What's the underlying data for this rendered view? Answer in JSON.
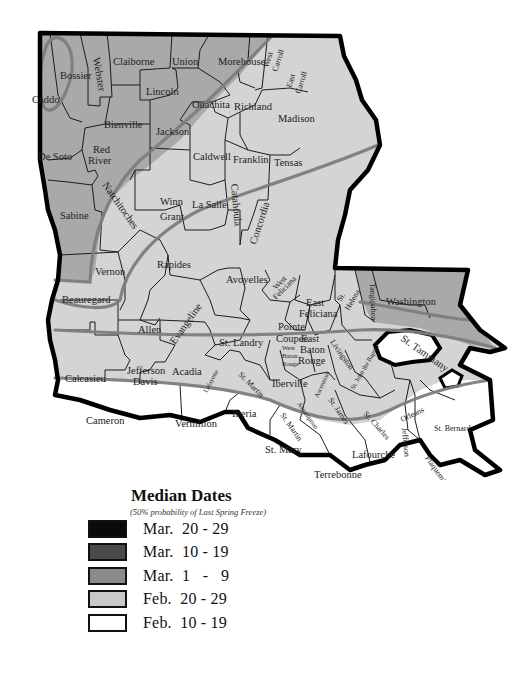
{
  "map": {
    "title": "Louisiana Median Dates of Last Spring Freeze",
    "parishes": [
      {
        "name": "Caddo",
        "zone": "mar1"
      },
      {
        "name": "Bossier",
        "zone": "mar1"
      },
      {
        "name": "Webster",
        "zone": "mar1"
      },
      {
        "name": "Claiborne",
        "zone": "mar1"
      },
      {
        "name": "Union",
        "zone": "mar1"
      },
      {
        "name": "Morehouse",
        "zone": "feb20"
      },
      {
        "name": "West Carroll",
        "zone": "feb20"
      },
      {
        "name": "East Carroll",
        "zone": "feb20"
      },
      {
        "name": "Lincoln",
        "zone": "mar1"
      },
      {
        "name": "Ouachita",
        "zone": "feb20"
      },
      {
        "name": "Richland",
        "zone": "feb20"
      },
      {
        "name": "Madison",
        "zone": "feb20"
      },
      {
        "name": "Bienville",
        "zone": "mar1"
      },
      {
        "name": "Jackson",
        "zone": "feb20"
      },
      {
        "name": "De Soto",
        "zone": "mar1"
      },
      {
        "name": "Red River",
        "zone": "mar1"
      },
      {
        "name": "Caldwell",
        "zone": "feb20"
      },
      {
        "name": "Franklin",
        "zone": "feb20"
      },
      {
        "name": "Tensas",
        "zone": "feb20"
      },
      {
        "name": "Winn",
        "zone": "feb20"
      },
      {
        "name": "Natchitoches",
        "zone": "feb20"
      },
      {
        "name": "Catahoula",
        "zone": "feb20"
      },
      {
        "name": "La Salle",
        "zone": "feb20"
      },
      {
        "name": "Grant",
        "zone": "feb20"
      },
      {
        "name": "Concordia",
        "zone": "feb20"
      },
      {
        "name": "Sabine",
        "zone": "mar1"
      },
      {
        "name": "Rapides",
        "zone": "feb20"
      },
      {
        "name": "Vernon",
        "zone": "feb20"
      },
      {
        "name": "Avoyelles",
        "zone": "feb20"
      },
      {
        "name": "West Feliciana",
        "zone": "feb20"
      },
      {
        "name": "East Feliciana",
        "zone": "feb20"
      },
      {
        "name": "St. Helena",
        "zone": "feb20"
      },
      {
        "name": "Washington",
        "zone": "mar1"
      },
      {
        "name": "Tangipahoa",
        "zone": "mar1"
      },
      {
        "name": "St. Tammany",
        "zone": "mar1"
      },
      {
        "name": "Beauregard",
        "zone": "feb20"
      },
      {
        "name": "Allen",
        "zone": "feb20"
      },
      {
        "name": "Evangeline",
        "zone": "feb20"
      },
      {
        "name": "Pointe Coupee",
        "zone": "feb20"
      },
      {
        "name": "East Baton Rouge",
        "zone": "feb20"
      },
      {
        "name": "West Baton Rouge",
        "zone": "feb20"
      },
      {
        "name": "St. Landry",
        "zone": "feb20"
      },
      {
        "name": "Livingston",
        "zone": "feb20"
      },
      {
        "name": "Calcasieu",
        "zone": "feb20"
      },
      {
        "name": "Jefferson Davis",
        "zone": "feb20"
      },
      {
        "name": "Acadia",
        "zone": "feb20"
      },
      {
        "name": "Lafayette",
        "zone": "feb20"
      },
      {
        "name": "St. Martin",
        "zone": "feb20"
      },
      {
        "name": "Iberville",
        "zone": "feb20"
      },
      {
        "name": "Ascension",
        "zone": "feb20"
      },
      {
        "name": "St. John the Baptist",
        "zone": "feb20"
      },
      {
        "name": "St. James",
        "zone": "feb20"
      },
      {
        "name": "Assumption",
        "zone": "feb20"
      },
      {
        "name": "St. Charles",
        "zone": "feb20"
      },
      {
        "name": "Orleans",
        "zone": "feb10"
      },
      {
        "name": "Cameron",
        "zone": "feb10"
      },
      {
        "name": "Vermilion",
        "zone": "feb10"
      },
      {
        "name": "Iberia",
        "zone": "feb10"
      },
      {
        "name": "St. Mary",
        "zone": "feb10"
      },
      {
        "name": "Lafourche",
        "zone": "feb10"
      },
      {
        "name": "Jefferson",
        "zone": "feb10"
      },
      {
        "name": "St. Bernard",
        "zone": "feb10"
      },
      {
        "name": "Plaquemines",
        "zone": "feb10"
      },
      {
        "name": "Terrebonne",
        "zone": "feb10"
      }
    ],
    "labels": {
      "caddo": "Caddo",
      "bossier": "Bossier",
      "webster": "Webster",
      "claiborne": "Claiborne",
      "union": "Union",
      "morehouse": "Morehouse",
      "west_carroll_1": "West",
      "west_carroll_2": "Carroll",
      "east_carroll_1": "East",
      "east_carroll_2": "Carroll",
      "lincoln": "Lincoln",
      "ouachita": "Ouachita",
      "richland": "Richland",
      "madison": "Madison",
      "bienville": "Bienville",
      "jackson": "Jackson",
      "desoto": "De Soto",
      "red_river_1": "Red",
      "red_river_2": "River",
      "caldwell": "Caldwell",
      "franklin": "Franklin",
      "tensas": "Tensas",
      "winn": "Winn",
      "natchitoches": "Natchitoches",
      "catahoula": "Catahoula",
      "lasalle": "La Salle",
      "grant": "Grant",
      "concordia": "Concordia",
      "sabine": "Sabine",
      "rapides": "Rapides",
      "vernon": "Vernon",
      "avoyelles": "Avoyelles",
      "west_feliciana_1": "West",
      "west_feliciana_2": "Feliciana",
      "east_feliciana_1": "East",
      "east_feliciana_2": "Feliciana",
      "st_helena_1": "St.",
      "st_helena_2": "Helena",
      "washington": "Washington",
      "tangipahoa": "Tangipahoa",
      "st_tammany": "St. Tammany",
      "beauregard": "Beauregard",
      "allen": "Allen",
      "evangeline": "Evangeline",
      "pointe_coupee_1": "Pointe",
      "pointe_coupee_2": "Coupee",
      "ebr_1": "East",
      "ebr_2": "Baton",
      "ebr_3": "Rouge",
      "wbr_1": "West",
      "wbr_2": "Baton",
      "wbr_3": "Rouge",
      "st_landry": "St. Landry",
      "livingston": "Livingston",
      "calcasieu": "Calcasieu",
      "jeff_davis_1": "Jefferson",
      "jeff_davis_2": "Davis",
      "acadia": "Acadia",
      "lafayette": "Lafayette",
      "st_martin": "St. Martin",
      "iberville": "Iberville",
      "ascension": "Ascension",
      "st_john": "St. John the Baptist",
      "st_james": "St. James",
      "assumption": "Assumption",
      "st_charles": "St. Charles",
      "orleans": "Orleans",
      "cameron": "Cameron",
      "vermilion": "Vermilion",
      "iberia": "Iberia",
      "st_martin_lower": "St. Martin",
      "st_mary": "St. Mary",
      "lafourche": "Lafourche",
      "jefferson": "Jefferson",
      "st_bernard": "St. Bernard",
      "plaquemines": "Plaquemines",
      "terrebonne": "Terrebonne"
    }
  },
  "legend": {
    "title": "Median Dates",
    "subtitle": "(50% probability of Last Spring Freeze)",
    "items": [
      {
        "label": "Mar.  20 - 29",
        "color": "#0a0a0a"
      },
      {
        "label": "Mar.  10 - 19",
        "color": "#4a4a4a"
      },
      {
        "label": "Mar.  1   -   9",
        "color": "#8a8a8a"
      },
      {
        "label": "Feb.  20 - 29",
        "color": "#c9c9c9"
      },
      {
        "label": "Feb.  10 - 19",
        "color": "#ffffff"
      }
    ]
  }
}
